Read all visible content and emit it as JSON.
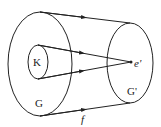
{
  "diagram": {
    "labels": {
      "K": "K",
      "G": "G",
      "G_prime": "G'",
      "e_prime": "e'",
      "f": "f"
    },
    "colors": {
      "stroke": "#222222",
      "background": "#ffffff"
    }
  }
}
